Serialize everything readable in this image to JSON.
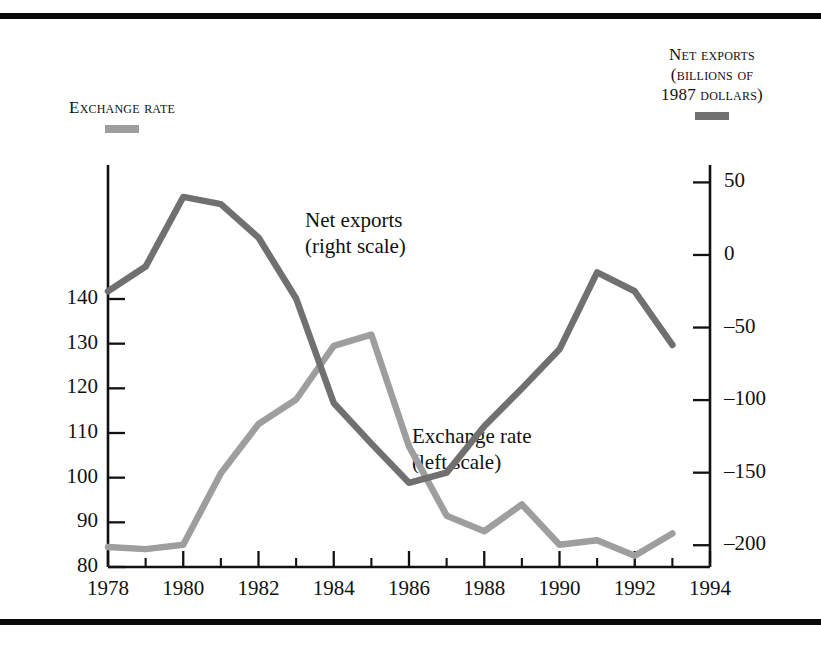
{
  "legend_left": {
    "caption": "Exchange rate",
    "swatch_color": "#9e9e9e",
    "swatch_name": "exchange-rate-swatch"
  },
  "legend_right": {
    "line1": "Net exports",
    "line2": "(billions of",
    "line3": "1987 dollars)",
    "swatch_color": "#707070",
    "swatch_name": "net-exports-swatch"
  },
  "annotations": {
    "net_exports_line1": "Net exports",
    "net_exports_line2": "(right scale)",
    "exchange_rate_line1": "Exchange rate",
    "exchange_rate_line2": "(left scale)"
  },
  "chart_data": {
    "type": "line",
    "title": "",
    "xlabel": "",
    "ylabel": "",
    "grid": false,
    "legend_position": "outside-top",
    "x": [
      1978,
      1979,
      1980,
      1981,
      1982,
      1983,
      1984,
      1985,
      1986,
      1987,
      1988,
      1989,
      1990,
      1991,
      1992,
      1993
    ],
    "xlim": [
      1978,
      1994
    ],
    "xticks_major": [
      1978,
      1980,
      1982,
      1984,
      1986,
      1988,
      1990,
      1992,
      1994
    ],
    "xticks_major_labels": [
      "1978",
      "1980",
      "1982",
      "1984",
      "1986",
      "1988",
      "1990",
      "1992",
      "1994"
    ],
    "xticks_minor": [
      1979,
      1981,
      1983,
      1985,
      1987,
      1989,
      1991,
      1993
    ],
    "left_axis": {
      "name": "Exchange rate",
      "ticks": [
        80,
        90,
        100,
        110,
        120,
        130,
        140
      ],
      "tick_labels": [
        "80",
        "90",
        "100",
        "110",
        "120",
        "130",
        "140"
      ],
      "ylim": [
        80,
        170
      ]
    },
    "right_axis": {
      "name": "Net exports (billions of 1987 dollars)",
      "ticks": [
        50,
        0,
        -50,
        -100,
        -150,
        -200
      ],
      "tick_labels": [
        "50",
        "0",
        "–50",
        "–100",
        "–150",
        "–200"
      ],
      "ylim": [
        -215,
        62
      ]
    },
    "series": [
      {
        "name": "Exchange rate",
        "axis": "left",
        "color": "#9e9e9e",
        "values": [
          84.5,
          84.0,
          85.0,
          101.0,
          112.0,
          117.5,
          129.5,
          132.0,
          107.0,
          91.5,
          88.0,
          94.0,
          85.0,
          86.0,
          82.5,
          87.5
        ]
      },
      {
        "name": "Net exports",
        "axis": "right",
        "color": "#707070",
        "values": [
          -25,
          -8,
          40,
          35,
          12,
          -30,
          -102,
          -130,
          -157,
          -150,
          -118,
          -92,
          -65,
          -12,
          -25,
          -62
        ]
      }
    ]
  }
}
